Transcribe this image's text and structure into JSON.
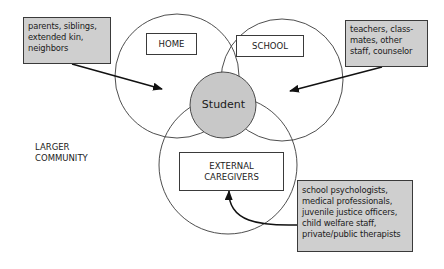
{
  "colors": {
    "stroke": "#3a3a3a",
    "gray_fill": "#cfcfcf",
    "student_fill": "#c8c8c8",
    "background": "#ffffff"
  },
  "circles": {
    "home": {
      "label": "HOME"
    },
    "school": {
      "label": "SCHOOL"
    },
    "external": {
      "label_line1": "EXTERNAL",
      "label_line2": "CAREGIVERS"
    },
    "student": {
      "label": "Student"
    }
  },
  "callouts": {
    "home_people": {
      "lines": [
        "parents, siblings,",
        "extended kin,",
        "neighbors"
      ]
    },
    "school_people": {
      "lines": [
        "teachers, class-",
        "mates, other",
        "staff, counselor"
      ]
    },
    "external_people": {
      "lines": [
        "school psychologists,",
        "medical professionals,",
        "juvenile justice officers,",
        "child welfare staff,",
        "private/public therapists"
      ]
    }
  },
  "community": {
    "line1": "LARGER",
    "line2": "COMMUNITY"
  }
}
